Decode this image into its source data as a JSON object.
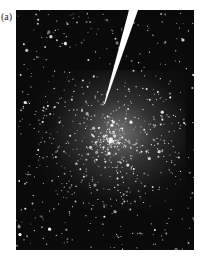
{
  "figure": {
    "panel_label": "(a)",
    "colors": {
      "background": "#0a0a0a",
      "stars": "#ffffff",
      "wedge": "#ffffff"
    }
  }
}
